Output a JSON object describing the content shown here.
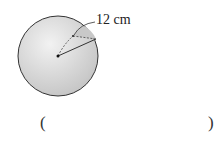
{
  "figure": {
    "shape": "sphere",
    "radius_label": "12 cm"
  },
  "answer": {
    "open_paren": "(",
    "close_paren": ")",
    "value": ""
  },
  "colors": {
    "sphere_fill": "#d4d4d4",
    "outline": "#333333"
  }
}
